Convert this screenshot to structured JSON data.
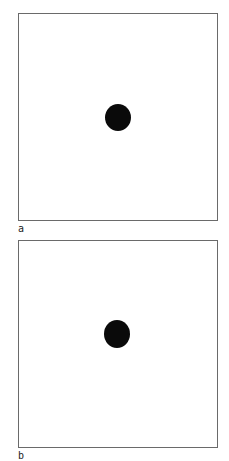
{
  "panels": [
    {
      "label": "a",
      "dot": {
        "shape": "filled-circle",
        "color": "#0a0a0a"
      }
    },
    {
      "label": "b",
      "dot": {
        "shape": "filled-circle",
        "color": "#0a0a0a"
      }
    }
  ]
}
